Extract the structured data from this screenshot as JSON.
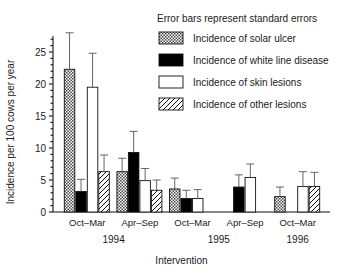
{
  "chart_data": {
    "type": "bar",
    "title": "",
    "xlabel": "Intervention",
    "ylabel": "Incidence per 100 cows per year",
    "ylim": [
      0,
      28.5
    ],
    "yticks": [
      0,
      5,
      10,
      15,
      20,
      25
    ],
    "grid": false,
    "legend_position": "top-right",
    "legend_title": "Error bars represent standard errors",
    "error_bars": "standard errors",
    "categories": [
      "Oct–Mar",
      "Apr–Sep",
      "Oct–Mar",
      "Apr–Sep",
      "Oct–Mar"
    ],
    "group_years": [
      {
        "label": "1994",
        "spans": [
          0,
          1
        ]
      },
      {
        "label": "1995",
        "spans": [
          2,
          3
        ]
      },
      {
        "label": "1996",
        "spans": [
          4,
          4
        ]
      }
    ],
    "series": [
      {
        "name": "Incidence of solar ulcer",
        "pattern": "stippled",
        "values": [
          22.3,
          6.3,
          3.6,
          null,
          2.4
        ],
        "errors": [
          5.7,
          2.1,
          1.7,
          null,
          1.5
        ]
      },
      {
        "name": "Incidence of white line disease",
        "pattern": "solid-black",
        "values": [
          3.2,
          9.3,
          2.1,
          3.9,
          null
        ],
        "errors": [
          1.9,
          3.3,
          1.3,
          1.9,
          null
        ]
      },
      {
        "name": "Incidence of skin lesions",
        "pattern": "white",
        "values": [
          19.5,
          4.9,
          2.1,
          5.4,
          4.0
        ],
        "errors": [
          5.3,
          1.9,
          1.4,
          2.1,
          2.3
        ]
      },
      {
        "name": "Incidence of other lesions",
        "pattern": "hatched",
        "values": [
          6.3,
          3.4,
          null,
          null,
          4.0
        ],
        "errors": [
          2.6,
          1.6,
          null,
          null,
          2.2
        ]
      }
    ]
  },
  "legend": {
    "title": "Error bars represent standard errors",
    "items": [
      {
        "label": "Incidence of solar ulcer",
        "pattern": "stippled"
      },
      {
        "label": "Incidence of white line disease",
        "pattern": "solid-black"
      },
      {
        "label": "Incidence of skin lesions",
        "pattern": "white"
      },
      {
        "label": "Incidence of other lesions",
        "pattern": "hatched"
      }
    ]
  },
  "axes": {
    "y_title": "Incidence per 100 cows per year",
    "x_title": "Intervention",
    "y_tick_labels": [
      "0",
      "5",
      "10",
      "15",
      "20",
      "25"
    ],
    "x_tick_labels": [
      "Oct–Mar",
      "Apr–Sep",
      "Oct–Mar",
      "Apr–Sep",
      "Oct–Mar"
    ],
    "year_labels": [
      "1994",
      "1995",
      "1996"
    ]
  },
  "colors": {
    "ink": "#111111",
    "fill_black": "#000000",
    "fill_white": "#ffffff",
    "error_bar": "#555555"
  }
}
